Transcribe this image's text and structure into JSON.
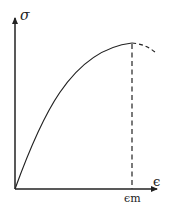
{
  "diagram": {
    "title": "",
    "y_axis_label": "σ",
    "x_axis_label": "ϵ",
    "marker_label": "ϵm",
    "line_color": "#222222",
    "curve": {
      "type": "concave stress-strain curve",
      "start": [
        15,
        189
      ],
      "peak": [
        132,
        43
      ],
      "dashed_continuation_end": [
        156,
        53
      ]
    }
  }
}
